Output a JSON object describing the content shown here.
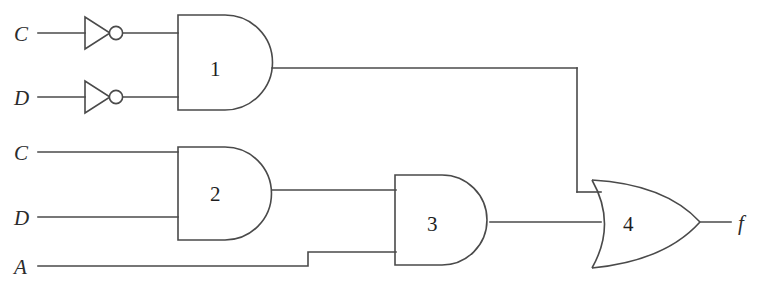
{
  "diagram": {
    "type": "logic-circuit-schematic",
    "line_color": "#4a4a4a",
    "background_color": "#ffffff",
    "width": 763,
    "height": 294
  },
  "inputs": [
    {
      "id": "in-c-top",
      "label": "C",
      "x": 20,
      "y": 33,
      "wire_y": 33,
      "inverted": true,
      "target_gate": "1"
    },
    {
      "id": "in-d-top",
      "label": "D",
      "x": 20,
      "y": 97,
      "wire_y": 97,
      "inverted": true,
      "target_gate": "1"
    },
    {
      "id": "in-c-bottom",
      "label": "C",
      "x": 20,
      "y": 152,
      "wire_y": 152,
      "inverted": false,
      "target_gate": "2"
    },
    {
      "id": "in-d-bottom",
      "label": "D",
      "x": 20,
      "y": 217,
      "wire_y": 217,
      "inverted": false,
      "target_gate": "2"
    },
    {
      "id": "in-a",
      "label": "A",
      "x": 20,
      "y": 266,
      "wire_y": 266,
      "inverted": false,
      "target_gate": "3"
    }
  ],
  "inverters": [
    {
      "id": "inv-c",
      "for_input": "C",
      "cy": 33,
      "tip_x": 110,
      "bubble_cx": 116
    },
    {
      "id": "inv-d",
      "for_input": "D",
      "cy": 97,
      "tip_x": 110,
      "bubble_cx": 116
    }
  ],
  "gates": [
    {
      "id": "gate-1",
      "number": "1",
      "type": "AND",
      "label_x": 215,
      "label_y": 75,
      "left_x": 178,
      "top_y": 15,
      "bottom_y": 110,
      "out_x": 272,
      "out_y": 68,
      "inputs": [
        "NOT C",
        "NOT D"
      ],
      "output_to": "gate-4"
    },
    {
      "id": "gate-2",
      "number": "2",
      "type": "AND",
      "label_x": 215,
      "label_y": 200,
      "left_x": 178,
      "top_y": 147,
      "bottom_y": 240,
      "out_x": 272,
      "out_y": 190,
      "inputs": [
        "C",
        "D"
      ],
      "output_to": "gate-3"
    },
    {
      "id": "gate-3",
      "number": "3",
      "type": "AND",
      "label_x": 432,
      "label_y": 230,
      "left_x": 395,
      "top_y": 175,
      "bottom_y": 265,
      "out_x": 490,
      "out_y": 222,
      "inputs": [
        "gate-2 output",
        "A"
      ],
      "output_to": "gate-4"
    },
    {
      "id": "gate-4",
      "number": "4",
      "type": "OR",
      "label_x": 628,
      "label_y": 230,
      "left_x": 592,
      "top_y": 180,
      "bottom_y": 268,
      "out_x": 700,
      "out_y": 222,
      "inputs": [
        "gate-1 output",
        "gate-3 output"
      ],
      "output_to": "f"
    }
  ],
  "output": {
    "id": "out-f",
    "label": "f",
    "label_x": 741,
    "label_y": 229,
    "wire_start_x": 700,
    "wire_end_x": 731,
    "wire_y": 222
  },
  "routing": {
    "gate1_out_run_to_x": 577,
    "gate1_drop_to_y": 192,
    "gate1_into_or_x": 600,
    "a_step_x": 308,
    "a_low_y": 266,
    "a_high_y": 252,
    "a_into_gate3_x": 395
  },
  "expression": {
    "gate1": "C' · D'",
    "gate2": "C · D",
    "gate3": "(C · D) · A",
    "gate4": "f = (C' · D') + (C · D · A)"
  }
}
